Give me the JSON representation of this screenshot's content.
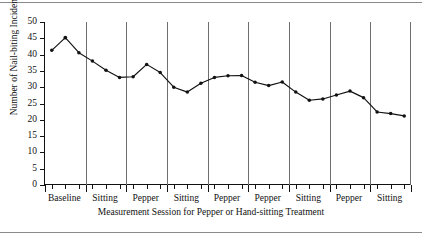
{
  "chart_data": {
    "type": "line",
    "title": "",
    "xlabel": "Measurement Session for Pepper or Hand-sitting Treatment",
    "ylabel": "Number of Nail-biting Incidents",
    "ylim": [
      0,
      50
    ],
    "ytick_labels": [
      "0",
      "5",
      "10",
      "15",
      "20",
      "25",
      "30",
      "35",
      "40",
      "45",
      "50"
    ],
    "ytick_values": [
      0,
      5,
      10,
      15,
      20,
      25,
      30,
      35,
      40,
      45,
      50
    ],
    "grid": false,
    "legend": "none",
    "marker": "filled-circle",
    "line_color": "#111111",
    "divider_color": "#6f6f6f",
    "phases": [
      {
        "label": "Baseline",
        "sessions": 3
      },
      {
        "label": "Sitting",
        "sessions": 3
      },
      {
        "label": "Pepper",
        "sessions": 3
      },
      {
        "label": "Sitting",
        "sessions": 3
      },
      {
        "label": "Pepper",
        "sessions": 3
      },
      {
        "label": "Pepper",
        "sessions": 3
      },
      {
        "label": "Sitting",
        "sessions": 3
      },
      {
        "label": "Pepper",
        "sessions": 3
      },
      {
        "label": "Sitting",
        "sessions": 3
      }
    ],
    "x": [
      1,
      2,
      3,
      4,
      5,
      6,
      7,
      8,
      9,
      10,
      11,
      12,
      13,
      14,
      15,
      16,
      17,
      18,
      19,
      20,
      21,
      22,
      23,
      24,
      25,
      26,
      27
    ],
    "values": [
      41.3,
      45.2,
      40.6,
      38.0,
      35.2,
      33.0,
      33.2,
      37.0,
      34.5,
      30.0,
      28.5,
      31.2,
      33.0,
      33.5,
      33.6,
      31.5,
      30.5,
      31.6,
      28.5,
      26.0,
      26.4,
      27.6,
      28.8,
      26.8,
      22.4,
      21.9,
      21.2
    ],
    "series": [
      {
        "name": "Nail-biting incidents",
        "values": [
          41.3,
          45.2,
          40.6,
          38.0,
          35.2,
          33.0,
          33.2,
          37.0,
          34.5,
          30.0,
          28.5,
          31.2,
          33.0,
          33.5,
          33.6,
          31.5,
          30.5,
          31.6,
          28.5,
          26.0,
          26.4,
          27.6,
          28.8,
          26.8,
          22.4,
          21.9,
          21.2
        ]
      }
    ]
  }
}
